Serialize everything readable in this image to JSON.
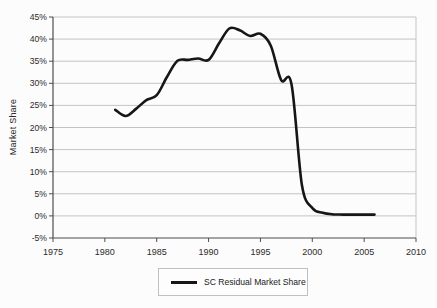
{
  "figure": {
    "background": "#fcfcfc",
    "colors": {
      "line": "#161616",
      "grid": "#c4c4c4",
      "axis": "#4d4d4d",
      "tick_text": "#2b2b2b",
      "legend_border": "#c0c0c0"
    }
  },
  "chart_data": {
    "type": "line",
    "title": "",
    "xlabel": "",
    "ylabel": "Market Share",
    "xlim": [
      1975,
      2010
    ],
    "ylim": [
      -5,
      45
    ],
    "x_ticks": [
      1975,
      1980,
      1985,
      1990,
      1995,
      2000,
      2005,
      2010
    ],
    "y_ticks": [
      -5,
      0,
      5,
      10,
      15,
      20,
      25,
      30,
      35,
      40,
      45
    ],
    "y_tick_suffix": "%",
    "grid": true,
    "legend_position": "bottom",
    "series": [
      {
        "name": "SC Residual Market Share",
        "color": "#161616",
        "x": [
          1981,
          1982,
          1983,
          1984,
          1985,
          1986,
          1987,
          1988,
          1989,
          1990,
          1991,
          1992,
          1993,
          1994,
          1995,
          1996,
          1997,
          1998,
          1999,
          2000,
          2001,
          2002,
          2003,
          2004,
          2005,
          2006
        ],
        "y": [
          24.0,
          22.6,
          24.2,
          26.2,
          27.3,
          31.5,
          35.1,
          35.3,
          35.6,
          35.3,
          39.0,
          42.4,
          42.0,
          40.7,
          41.2,
          38.5,
          30.7,
          29.8,
          7.0,
          1.8,
          0.7,
          0.35,
          0.3,
          0.3,
          0.3,
          0.3
        ]
      }
    ]
  }
}
